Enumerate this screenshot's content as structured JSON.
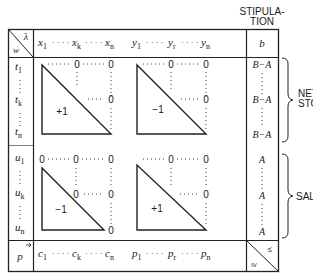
{
  "stipulation_header": {
    "line1": "STIPULA-",
    "line2": "TION"
  },
  "corner_top_left": {
    "upper": "λ",
    "lower": "w"
  },
  "header_row": {
    "x_vars": [
      {
        "base": "x",
        "sub": "1"
      },
      {
        "base": "x",
        "sub": "k"
      },
      {
        "base": "x",
        "sub": "n"
      }
    ],
    "y_vars": [
      {
        "base": "y",
        "sub": "1"
      },
      {
        "base": "y",
        "sub": "r"
      },
      {
        "base": "y",
        "sub": "n"
      }
    ],
    "stipulation": "b"
  },
  "row_labels_t": [
    {
      "base": "t",
      "sub": "1"
    },
    {
      "base": "t",
      "sub": "k"
    },
    {
      "base": "t",
      "sub": "n"
    }
  ],
  "row_labels_u": [
    {
      "base": "u",
      "sub": "1"
    },
    {
      "base": "u",
      "sub": "k"
    },
    {
      "base": "u",
      "sub": "n"
    }
  ],
  "blocks": {
    "top_left": {
      "triangle_label": "+1",
      "zero": "0"
    },
    "top_right": {
      "triangle_label": "−1",
      "zero": "0"
    },
    "bottom_left": {
      "triangle_label": "−1",
      "zero": "0"
    },
    "bottom_right": {
      "triangle_label": "+1",
      "zero": "0"
    }
  },
  "stipulation_values": {
    "t_rows": [
      "B−A",
      "B−A",
      "B−A"
    ],
    "u_rows": [
      "A",
      "A",
      "A"
    ]
  },
  "bottom_row": {
    "label": "p",
    "c_vars": [
      {
        "base": "c",
        "sub": "1"
      },
      {
        "base": "c",
        "sub": "k"
      },
      {
        "base": "c",
        "sub": "n"
      }
    ],
    "p_vars": [
      {
        "base": "p",
        "sub": "1"
      },
      {
        "base": "p",
        "sub": "r"
      },
      {
        "base": "p",
        "sub": "n"
      }
    ],
    "corner_upper": "≤",
    "corner_lower": "IV"
  },
  "braces": {
    "net_storage": {
      "line1": "NET",
      "line2": "STORAGE"
    },
    "sales": {
      "label": "SALES"
    }
  },
  "ellipsis": "· · · ·"
}
